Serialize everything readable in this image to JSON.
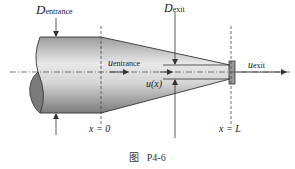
{
  "figure": {
    "caption_prefix": "图",
    "caption_id": "P4-6"
  },
  "labels": {
    "d_entrance": {
      "symbol": "D",
      "subscript": "entrance"
    },
    "d_exit": {
      "symbol": "D",
      "subscript": "exit"
    },
    "u_entrance": {
      "symbol": "u",
      "subscript": "entrance"
    },
    "u_exit": {
      "symbol": "u",
      "subscript": "exit"
    },
    "u_x": "u(x)",
    "x_zero": "x = 0",
    "x_L": "x = L"
  },
  "colors": {
    "pipe_light": "#e2e2e2",
    "pipe_dark": "#8a8a8a",
    "outline": "#333333",
    "cut_face": "#7a7a7a"
  }
}
